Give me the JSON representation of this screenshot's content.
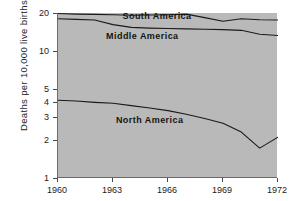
{
  "chart_data": {
    "type": "line",
    "title": "",
    "xlabel": "",
    "ylabel": "Deaths per 10,000 live births",
    "yscale": "log",
    "ylim": [
      1,
      20
    ],
    "xlim": [
      1960,
      1972
    ],
    "grid": false,
    "legend_position": "inline-annotations",
    "plot_background": "#b9b9b9",
    "line_color": "#1a1a1a",
    "yticks": [
      1,
      2,
      3,
      4,
      5,
      10,
      20
    ],
    "ytick_labels": [
      "1",
      "2",
      "3",
      "4",
      "5",
      "10",
      "20"
    ],
    "xticks": [
      1960,
      1963,
      1966,
      1969,
      1972
    ],
    "xtick_labels": [
      "1960",
      "1963",
      "1966",
      "1969",
      "1972"
    ],
    "x": [
      1960,
      1961,
      1962,
      1963,
      1964,
      1965,
      1966,
      1967,
      1968,
      1969,
      1970,
      1971,
      1972
    ],
    "series": [
      {
        "name": "South America",
        "label": "South America",
        "values": [
          19.8,
          19.6,
          19.5,
          19.4,
          19.2,
          19.3,
          19.4,
          19.6,
          18.4,
          17.2,
          18.0,
          17.7,
          17.6
        ]
      },
      {
        "name": "Middle America",
        "label": "Middle America",
        "values": [
          18.0,
          17.8,
          17.6,
          16.2,
          15.4,
          15.2,
          15.1,
          15.0,
          14.9,
          14.8,
          14.6,
          13.6,
          13.3
        ]
      },
      {
        "name": "North America",
        "label": "North America",
        "values": [
          4.1,
          4.05,
          3.95,
          3.88,
          3.72,
          3.56,
          3.4,
          3.18,
          2.95,
          2.7,
          2.3,
          1.72,
          2.1
        ]
      }
    ],
    "annotations": [
      {
        "text": "South America",
        "x": 1965.4,
        "y": 19.0
      },
      {
        "text": "Middle America",
        "x": 1964.6,
        "y": 13.2
      },
      {
        "text": "North America",
        "x": 1965.0,
        "y": 2.85
      }
    ]
  }
}
